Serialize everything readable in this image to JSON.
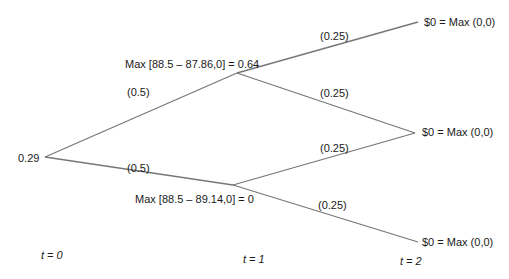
{
  "diagram": {
    "type": "binomial-tree",
    "line_color": "#777777",
    "root": {
      "value": "0.29"
    },
    "t1_nodes": [
      {
        "label": "Max [88.5 – 87.86,0] = 0.64"
      },
      {
        "label": "Max [88.5 – 89.14,0] = 0"
      }
    ],
    "t2_nodes": [
      {
        "label": "$0 = Max (0,0)"
      },
      {
        "label": "$0 = Max (0,0)"
      },
      {
        "label": "$0 = Max (0,0)"
      }
    ],
    "branch_probs": {
      "root_up": "(0.5)",
      "root_down": "(0.5)",
      "up_up": "(0.25)",
      "up_down": "(0.25)",
      "down_up": "(0.25)",
      "down_down": "(0.25)"
    },
    "time_labels": {
      "t0": "t = 0",
      "t1": "t = 1",
      "t2": "t = 2"
    }
  }
}
